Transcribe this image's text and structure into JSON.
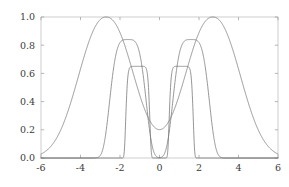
{
  "figure": {
    "title": "",
    "background_color": "#ffffff",
    "curve_color": "#7a7a7a",
    "frame_color": "#b9b9b9",
    "tick_label_color": "#3b3b3b"
  },
  "chart_data": {
    "type": "line",
    "title": "",
    "subtitle": "",
    "xlabel": "",
    "ylabel": "",
    "xlim": [
      -6,
      6
    ],
    "ylim": [
      0.0,
      1.0
    ],
    "grid": false,
    "legend": null,
    "legend_position": "none",
    "xticks": [
      -6,
      -4,
      -2,
      0,
      2,
      4,
      6
    ],
    "xtick_labels": [
      "-6",
      "-4",
      "-2",
      "0",
      "2",
      "4",
      "6"
    ],
    "yticks": [
      0.0,
      0.2,
      0.4,
      0.6,
      0.8,
      1.0
    ],
    "ytick_labels": [
      "0.0",
      "0.2",
      "0.4",
      "0.6",
      "0.8",
      "1.0"
    ],
    "annotations": [],
    "series": [
      {
        "name": "broad low-order bimodal curve",
        "peak_height": 1.0,
        "peak_positions": [
          -2.7,
          2.7
        ],
        "shape": "super-gaussian order 2.2, width 1.85",
        "order": 2.2,
        "width": 1.85,
        "center": 2.7,
        "amplitude": 1.0
      },
      {
        "name": "mid bimodal curve",
        "peak_height": 0.84,
        "peak_positions": [
          -1.6,
          1.6
        ],
        "shape": "super-gaussian order 4.0, width 1.0",
        "order": 4.0,
        "width": 1.0,
        "center": 1.6,
        "amplitude": 0.84
      },
      {
        "name": "narrow flat-topped bimodal curve",
        "peak_height": 0.65,
        "peak_positions": [
          -1.1,
          1.1
        ],
        "shape": "super-gaussian order 10.0, width 0.62",
        "order": 10.0,
        "width": 0.62,
        "center": 1.1,
        "amplitude": 0.65
      }
    ]
  },
  "axes": {
    "x_axis_name": "x-axis",
    "y_axis_name": "y-axis"
  }
}
